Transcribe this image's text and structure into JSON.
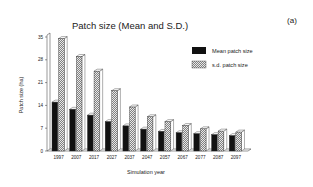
{
  "chart_data": {
    "type": "bar",
    "title": "Patch size (Mean and S.D.)",
    "panel_label": "(a)",
    "xlabel": "Simulation year",
    "ylabel": "Patch size (ha)",
    "ylim": [
      0,
      35
    ],
    "yticks": [
      0,
      7,
      14,
      21,
      28,
      35
    ],
    "categories": [
      "1997",
      "2007",
      "2017",
      "2027",
      "2037",
      "2047",
      "2057",
      "2067",
      "2077",
      "2087",
      "2097"
    ],
    "series": [
      {
        "name": "Mean patch size",
        "style": "solid-black",
        "values": [
          15.0,
          12.8,
          11.0,
          9.0,
          7.7,
          6.7,
          6.0,
          5.6,
          5.3,
          5.0,
          4.7
        ]
      },
      {
        "name": "s.d. patch size",
        "style": "hatched",
        "values": [
          34.5,
          29.0,
          24.5,
          18.5,
          13.5,
          10.5,
          9.0,
          7.8,
          6.8,
          6.1,
          5.8
        ]
      }
    ],
    "legend_position": "top-right",
    "grid": false,
    "style": "3d"
  }
}
